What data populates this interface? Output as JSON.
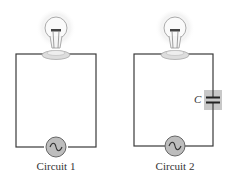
{
  "circuits": [
    {
      "label": "Circuit 1",
      "components": [
        "light-bulb",
        "ac-source"
      ]
    },
    {
      "label": "Circuit 2",
      "components": [
        "light-bulb",
        "ac-source",
        "capacitor"
      ],
      "capacitor_label": "C"
    }
  ],
  "colors": {
    "wire": "#3a3a3a",
    "source_fill": "#bdbdbd",
    "capacitor_box": "#c8c8c8",
    "bulb_glow": "#f2f2f2"
  }
}
